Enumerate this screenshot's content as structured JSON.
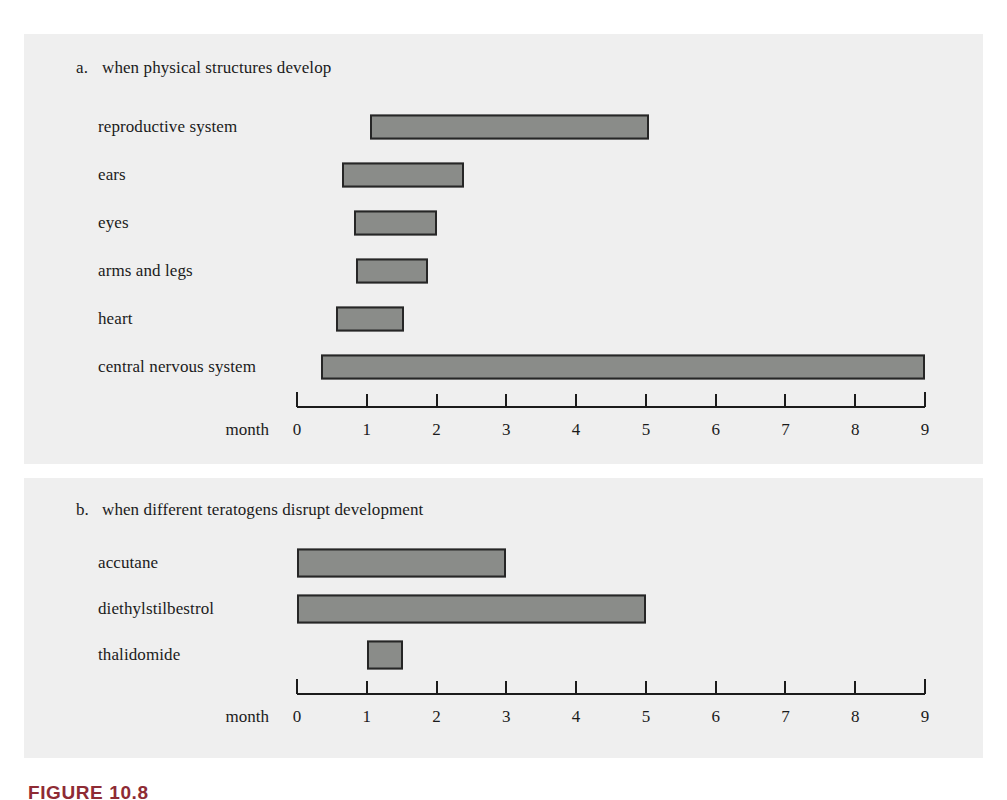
{
  "figure": {
    "caption": "FIGURE 10.8",
    "caption_color": "#8e2b34",
    "background_color": "#ffffff",
    "panel_background_color": "#efefef",
    "bar_fill_color": "#8a8c89",
    "bar_border_color": "#262626",
    "text_color": "#1b1b1b"
  },
  "panels": [
    {
      "enumerator": "a.",
      "title": "when physical structures develop",
      "axis_name": "month"
    },
    {
      "enumerator": "b.",
      "title": "when different teratogens disrupt development",
      "axis_name": "month"
    }
  ],
  "axis": {
    "name": "month",
    "ticks": [
      "0",
      "1",
      "2",
      "3",
      "4",
      "5",
      "6",
      "7",
      "8",
      "9"
    ],
    "min": 0,
    "max": 9
  },
  "chart_data": [
    {
      "type": "bar",
      "orientation": "horizontal-range",
      "title": "when physical structures develop",
      "panel": "a",
      "xlabel": "month",
      "ylabel": "",
      "xlim": [
        0,
        9
      ],
      "grid": false,
      "legend": "none",
      "categories": [
        "reproductive system",
        "ears",
        "eyes",
        "arms and legs",
        "heart",
        "central nervous system"
      ],
      "bars": [
        {
          "label": "reproductive system",
          "start": 1.05,
          "end": 5.05
        },
        {
          "label": "ears",
          "start": 0.65,
          "end": 2.4
        },
        {
          "label": "eyes",
          "start": 0.82,
          "end": 2.0
        },
        {
          "label": "arms and legs",
          "start": 0.85,
          "end": 1.88
        },
        {
          "label": "heart",
          "start": 0.56,
          "end": 1.53
        },
        {
          "label": "central nervous system",
          "start": 0.35,
          "end": 9.0
        }
      ]
    },
    {
      "type": "bar",
      "orientation": "horizontal-range",
      "title": "when different teratogens disrupt development",
      "panel": "b",
      "xlabel": "month",
      "ylabel": "",
      "xlim": [
        0,
        9
      ],
      "grid": false,
      "legend": "none",
      "categories": [
        "accutane",
        "diethylstilbestrol",
        "thalidomide"
      ],
      "bars": [
        {
          "label": "accutane",
          "start": 0.0,
          "end": 3.0
        },
        {
          "label": "diethylstilbestrol",
          "start": 0.0,
          "end": 5.0
        },
        {
          "label": "thalidomide",
          "start": 1.0,
          "end": 1.52
        }
      ]
    }
  ]
}
